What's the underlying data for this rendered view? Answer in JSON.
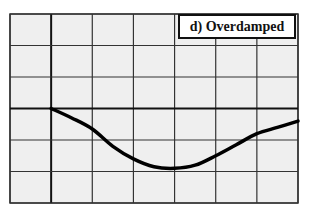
{
  "chart_data": {
    "type": "line",
    "title": "d) Overdamped",
    "xlabel": "",
    "ylabel": "",
    "grid": true,
    "grid_columns": 7,
    "grid_rows": 6,
    "x_divisions": [
      -1,
      0,
      1,
      2,
      3,
      4,
      5,
      6
    ],
    "y_divisions": [
      3,
      2,
      1,
      0,
      -1,
      -2,
      -3
    ],
    "xlim": [
      -1,
      6
    ],
    "ylim": [
      -3,
      3
    ],
    "legend_position": "top-right",
    "series": [
      {
        "name": "Overdamped response",
        "x": [
          0,
          0.5,
          1.0,
          1.5,
          2.0,
          2.5,
          3.0,
          3.5,
          4.0,
          4.5,
          5.0,
          5.5,
          6.0
        ],
        "y": [
          0,
          -0.3,
          -0.65,
          -1.2,
          -1.6,
          -1.85,
          -1.9,
          -1.8,
          -1.5,
          -1.15,
          -0.8,
          -0.6,
          -0.4
        ]
      }
    ]
  },
  "colors": {
    "background": "#f0f0f0",
    "grid": "#333333",
    "axis": "#111111",
    "curve": "#000000"
  }
}
